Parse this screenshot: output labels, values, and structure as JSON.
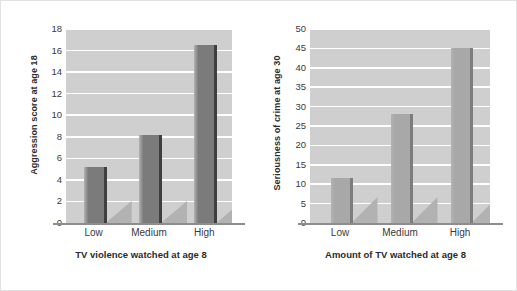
{
  "figure": {
    "background": "#ffffff",
    "border_color": "#e2e2e2",
    "plot_background": "#cfcfcf",
    "gridline_color": "#ffffff",
    "axis_color": "#8d8d8d"
  },
  "chart_data": [
    {
      "type": "bar",
      "title": "",
      "categories": [
        "Low",
        "Medium",
        "High"
      ],
      "values": [
        5.2,
        8.2,
        16.5
      ],
      "xlabel": "TV violence watched at age 8",
      "ylabel": "Aggression score at age 18",
      "ylim": [
        0,
        18
      ],
      "ytick_step": 2,
      "yticks": [
        0,
        2,
        4,
        6,
        8,
        10,
        12,
        14,
        16,
        18
      ],
      "ytick_labels": [
        "0",
        "2",
        "4",
        "6",
        "8",
        "10",
        "12",
        "14",
        "16",
        "18"
      ],
      "bar_color": "#7b7b7b",
      "bar_edge_color": "#3f3f3f",
      "shadow_color": "#b2b2b2",
      "grid": true,
      "legend": "none"
    },
    {
      "type": "bar",
      "title": "",
      "categories": [
        "Low",
        "Medium",
        "High"
      ],
      "values": [
        11.5,
        28,
        45
      ],
      "xlabel": "Amount of TV watched at age 8",
      "ylabel": "Seriousness of crime at age 30",
      "ylim": [
        0,
        50
      ],
      "ytick_step": 5,
      "yticks": [
        0,
        5,
        10,
        15,
        20,
        25,
        30,
        35,
        40,
        45,
        50
      ],
      "ytick_labels": [
        "0",
        "5",
        "10",
        "15",
        "20",
        "25",
        "30",
        "35",
        "40",
        "45",
        "50"
      ],
      "bar_color": "#a8a8a8",
      "bar_edge_color": "#7d7d7d",
      "shadow_color": "#b2b2b2",
      "grid": true,
      "legend": "none"
    }
  ]
}
